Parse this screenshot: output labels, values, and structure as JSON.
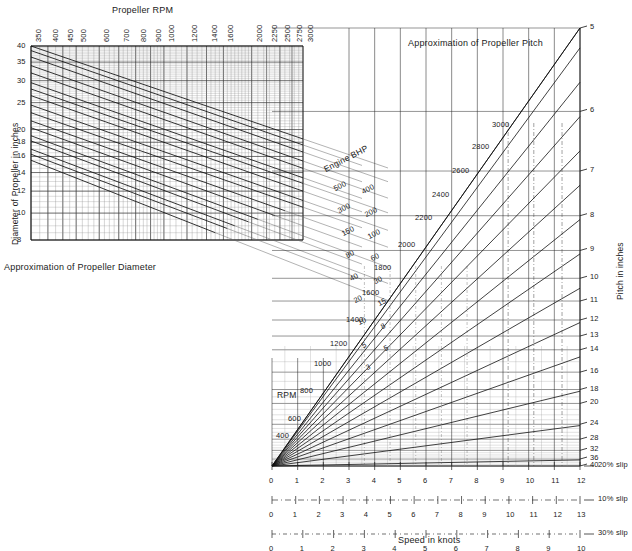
{
  "figure": {
    "left_chart": {
      "title": "Approximation of Propeller Diameter",
      "top_axis_label": "Propeller RPM",
      "y_axis_label": "Diameter of Propeller in inches",
      "diagonal_family_label": "Engine BHP",
      "rpm_ticks": [
        "350",
        "400",
        "450",
        "500",
        "600",
        "700",
        "800",
        "900",
        "1000",
        "1200",
        "1400",
        "1600",
        "2000",
        "2250",
        "2500",
        "2750",
        "3000"
      ],
      "diameter_ticks": [
        "40",
        "35",
        "30",
        "25",
        "20",
        "18",
        "16",
        "14",
        "12",
        "10",
        "8"
      ],
      "bhp_labels_upper": [
        "500",
        "400",
        "300",
        "200",
        "150",
        "100",
        "80",
        "60"
      ],
      "bhp_labels_lower": [
        "40",
        "30",
        "20",
        "15",
        "10",
        "8",
        "5",
        "5",
        "3"
      ],
      "bhp_all": [
        "500",
        "400",
        "300",
        "200",
        "150",
        "100",
        "80",
        "60",
        "40",
        "30",
        "20",
        "15",
        "10",
        "8",
        "5",
        "5",
        "3"
      ]
    },
    "right_chart": {
      "title": "Approximation of Propeller Pitch",
      "rpm_family_label": "RPM",
      "pitch_axis_label": "Pitch in inches",
      "speed_axis_label": "Speed in knots",
      "rpm_ticks": [
        "400",
        "600",
        "800",
        "1000",
        "1200",
        "1400",
        "1600",
        "1800",
        "2000",
        "2200",
        "2400",
        "2600",
        "2800",
        "3000"
      ],
      "pitch_ticks": [
        "5",
        "6",
        "7",
        "8",
        "9",
        "10",
        "11",
        "12",
        "13",
        "14",
        "16",
        "18",
        "20",
        "24",
        "28",
        "32",
        "36",
        "40"
      ],
      "slip_scales": [
        {
          "name": "20% slip",
          "ticks": [
            "0",
            "1",
            "2",
            "3",
            "4",
            "5",
            "6",
            "7",
            "8",
            "9",
            "10",
            "11",
            "12"
          ]
        },
        {
          "name": "10% slip",
          "ticks": [
            "0",
            "1",
            "2",
            "3",
            "4",
            "5",
            "6",
            "7",
            "8",
            "9",
            "10",
            "11",
            "12",
            "13"
          ]
        },
        {
          "name": "30% slip",
          "ticks": [
            "0",
            "1",
            "2",
            "3",
            "4",
            "5",
            "6",
            "7",
            "8",
            "9",
            "10"
          ]
        }
      ]
    }
  },
  "chart_data": {
    "type": "line",
    "panels": [
      {
        "name": "Approximation of Propeller Diameter",
        "type": "line",
        "xlabel": "Propeller RPM",
        "ylabel": "Diameter of Propeller in inches",
        "x_scale": "log",
        "y_scale": "log",
        "xlim": [
          350,
          3000
        ],
        "ylim": [
          8,
          40
        ],
        "xticks": [
          350,
          400,
          450,
          500,
          600,
          700,
          800,
          900,
          1000,
          1200,
          1400,
          1600,
          2000,
          2250,
          2500,
          2750,
          3000
        ],
        "yticks": [
          40,
          35,
          30,
          25,
          20,
          18,
          16,
          14,
          12,
          10,
          8
        ],
        "grid": true,
        "legend": "Engine BHP",
        "series": [
          {
            "name": "500 BHP",
            "x": [
              350,
              3000
            ],
            "y": [
              40,
              18.5
            ]
          },
          {
            "name": "400 BHP",
            "x": [
              350,
              3000
            ],
            "y": [
              38.5,
              17.6
            ]
          },
          {
            "name": "300 BHP",
            "x": [
              350,
              3000
            ],
            "y": [
              36.5,
              16.6
            ]
          },
          {
            "name": "200 BHP",
            "x": [
              350,
              3000
            ],
            "y": [
              34,
              15.4
            ]
          },
          {
            "name": "150 BHP",
            "x": [
              350,
              3000
            ],
            "y": [
              32,
              14.5
            ]
          },
          {
            "name": "100 BHP",
            "x": [
              350,
              3000
            ],
            "y": [
              29.5,
              13.4
            ]
          },
          {
            "name": "80 BHP",
            "x": [
              350,
              3000
            ],
            "y": [
              28,
              12.8
            ]
          },
          {
            "name": "60 BHP",
            "x": [
              350,
              3000
            ],
            "y": [
              26.5,
              12.0
            ]
          },
          {
            "name": "40 BHP",
            "x": [
              350,
              3000
            ],
            "y": [
              24.5,
              11.1
            ]
          },
          {
            "name": "30 BHP",
            "x": [
              350,
              3000
            ],
            "y": [
              23,
              10.5
            ]
          },
          {
            "name": "20 BHP",
            "x": [
              350,
              2600
            ],
            "y": [
              21.5,
              10.2
            ]
          },
          {
            "name": "15 BHP",
            "x": [
              350,
              2400
            ],
            "y": [
              20.3,
              9.8
            ]
          },
          {
            "name": "10 BHP",
            "x": [
              350,
              2100
            ],
            "y": [
              19,
              9.5
            ]
          },
          {
            "name": "8 BHP",
            "x": [
              350,
              1950
            ],
            "y": [
              18.2,
              9.3
            ]
          },
          {
            "name": "5 BHP",
            "x": [
              350,
              1750
            ],
            "y": [
              17,
              9.0
            ]
          },
          {
            "name": "4 BHP",
            "x": [
              350,
              1650
            ],
            "y": [
              16.3,
              8.8
            ]
          },
          {
            "name": "3 BHP",
            "x": [
              350,
              1500
            ],
            "y": [
              15.5,
              8.5
            ]
          }
        ]
      },
      {
        "name": "Approximation of Propeller Pitch",
        "type": "line",
        "xlabel": "Speed in knots",
        "ylabel": "Pitch in inches",
        "x_scale": "linear",
        "y_scale": "reciprocal",
        "xlim": [
          0,
          12
        ],
        "ylim": [
          40,
          5
        ],
        "yticks": [
          5,
          6,
          7,
          8,
          9,
          10,
          11,
          12,
          13,
          14,
          16,
          18,
          20,
          24,
          28,
          32,
          36,
          40
        ],
        "grid": true,
        "legend": "RPM",
        "series": [
          {
            "name": "400 RPM",
            "rpm": 400
          },
          {
            "name": "600 RPM",
            "rpm": 600
          },
          {
            "name": "800 RPM",
            "rpm": 800
          },
          {
            "name": "1000 RPM",
            "rpm": 1000
          },
          {
            "name": "1200 RPM",
            "rpm": 1200
          },
          {
            "name": "1400 RPM",
            "rpm": 1400
          },
          {
            "name": "1600 RPM",
            "rpm": 1600
          },
          {
            "name": "1800 RPM",
            "rpm": 1800
          },
          {
            "name": "2000 RPM",
            "rpm": 2000
          },
          {
            "name": "2200 RPM",
            "rpm": 2200
          },
          {
            "name": "2400 RPM",
            "rpm": 2400
          },
          {
            "name": "2600 RPM",
            "rpm": 2600
          },
          {
            "name": "2800 RPM",
            "rpm": 2800
          },
          {
            "name": "3000 RPM",
            "rpm": 3000
          }
        ],
        "auxiliary_scales": [
          {
            "name": "20% slip",
            "max": 12
          },
          {
            "name": "10% slip",
            "max": 13
          },
          {
            "name": "30% slip",
            "max": 10
          }
        ]
      }
    ]
  }
}
